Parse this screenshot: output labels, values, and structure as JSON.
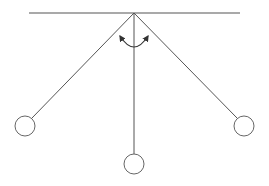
{
  "diagram": {
    "title": "",
    "colors": {
      "stroke": "#555555",
      "bob_stroke": "#666666",
      "background": "#ffffff"
    },
    "support": {
      "x1": 29,
      "y1": 13,
      "x2": 240,
      "y2": 13
    },
    "pivot": {
      "x": 134,
      "y": 13
    },
    "pendulums": [
      {
        "name": "left",
        "bob_x": 25,
        "bob_y": 126,
        "r": 10
      },
      {
        "name": "center",
        "bob_x": 134,
        "bob_y": 164,
        "r": 10
      },
      {
        "name": "right",
        "bob_x": 244,
        "bob_y": 126,
        "r": 10
      }
    ],
    "arc": {
      "radius": 37,
      "arrows": [
        "left",
        "right"
      ]
    }
  }
}
